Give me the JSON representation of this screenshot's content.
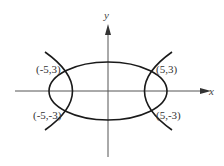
{
  "diagram": {
    "axes": {
      "x_label": "x",
      "y_label": "y"
    },
    "curves": [
      {
        "name": "ellipse",
        "center": [
          0,
          0
        ]
      },
      {
        "name": "hyperbola",
        "branches": [
          "left",
          "right"
        ]
      }
    ],
    "points": [
      {
        "label": "(-5,3)",
        "x": -5,
        "y": 3
      },
      {
        "label": "(5,3)",
        "x": 5,
        "y": 3
      },
      {
        "label": "(-5,-3)",
        "x": -5,
        "y": -3
      },
      {
        "label": "(5,-3)",
        "x": 5,
        "y": -3
      }
    ],
    "colors": {
      "curve": "#1a1a1a",
      "axis": "#555555",
      "text": "#333333"
    }
  }
}
